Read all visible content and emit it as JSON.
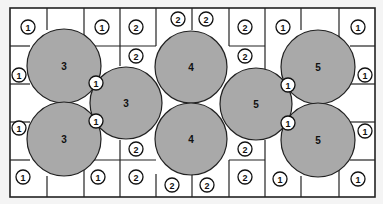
{
  "diagram": {
    "title": "",
    "grid": {
      "x": 10,
      "y": 8,
      "width": 365,
      "height": 189,
      "columns": [
        10,
        47,
        84,
        120,
        156,
        192,
        229,
        265,
        301,
        339,
        375
      ],
      "rows": [
        8,
        46,
        84,
        122,
        160,
        197
      ],
      "background": "#ffffff",
      "line_color": "#222222"
    },
    "partial_lines": [
      {
        "x1": 10,
        "y1": 46,
        "x2": 30,
        "y2": 46
      },
      {
        "x1": 10,
        "y1": 84,
        "x2": 30,
        "y2": 84
      },
      {
        "x1": 10,
        "y1": 122,
        "x2": 30,
        "y2": 122
      },
      {
        "x1": 10,
        "y1": 160,
        "x2": 30,
        "y2": 160
      },
      {
        "x1": 84,
        "y1": 8,
        "x2": 84,
        "y2": 46
      },
      {
        "x1": 120,
        "y1": 8,
        "x2": 120,
        "y2": 66
      },
      {
        "x1": 84,
        "y1": 160,
        "x2": 84,
        "y2": 197
      },
      {
        "x1": 120,
        "y1": 140,
        "x2": 120,
        "y2": 197
      },
      {
        "x1": 84,
        "y1": 46,
        "x2": 120,
        "y2": 46
      },
      {
        "x1": 84,
        "y1": 160,
        "x2": 120,
        "y2": 160
      },
      {
        "x1": 120,
        "y1": 46,
        "x2": 156,
        "y2": 46
      },
      {
        "x1": 120,
        "y1": 160,
        "x2": 156,
        "y2": 160
      },
      {
        "x1": 156,
        "y1": 8,
        "x2": 156,
        "y2": 46
      },
      {
        "x1": 192,
        "y1": 8,
        "x2": 192,
        "y2": 30
      },
      {
        "x1": 229,
        "y1": 8,
        "x2": 229,
        "y2": 46
      },
      {
        "x1": 156,
        "y1": 174,
        "x2": 156,
        "y2": 197
      },
      {
        "x1": 192,
        "y1": 174,
        "x2": 192,
        "y2": 197
      },
      {
        "x1": 229,
        "y1": 160,
        "x2": 229,
        "y2": 197
      },
      {
        "x1": 229,
        "y1": 46,
        "x2": 265,
        "y2": 46
      },
      {
        "x1": 229,
        "y1": 160,
        "x2": 265,
        "y2": 160
      },
      {
        "x1": 265,
        "y1": 8,
        "x2": 265,
        "y2": 70
      },
      {
        "x1": 265,
        "y1": 140,
        "x2": 265,
        "y2": 197
      },
      {
        "x1": 301,
        "y1": 8,
        "x2": 301,
        "y2": 30
      },
      {
        "x1": 301,
        "y1": 176,
        "x2": 301,
        "y2": 197
      },
      {
        "x1": 339,
        "y1": 8,
        "x2": 339,
        "y2": 46
      },
      {
        "x1": 339,
        "y1": 160,
        "x2": 339,
        "y2": 197
      },
      {
        "x1": 350,
        "y1": 46,
        "x2": 375,
        "y2": 46
      },
      {
        "x1": 350,
        "y1": 84,
        "x2": 375,
        "y2": 84
      },
      {
        "x1": 350,
        "y1": 122,
        "x2": 375,
        "y2": 122
      },
      {
        "x1": 350,
        "y1": 160,
        "x2": 375,
        "y2": 160
      },
      {
        "x1": 47,
        "y1": 8,
        "x2": 47,
        "y2": 30
      },
      {
        "x1": 47,
        "y1": 176,
        "x2": 47,
        "y2": 197
      }
    ],
    "discs": [
      {
        "label": "3",
        "cx": 64,
        "cy": 66,
        "r": 37
      },
      {
        "label": "3",
        "cx": 64,
        "cy": 139,
        "r": 37
      },
      {
        "label": "3",
        "cx": 126,
        "cy": 103,
        "r": 36
      },
      {
        "label": "4",
        "cx": 191,
        "cy": 67,
        "r": 36
      },
      {
        "label": "4",
        "cx": 191,
        "cy": 139,
        "r": 36
      },
      {
        "label": "5",
        "cx": 256,
        "cy": 104,
        "r": 36
      },
      {
        "label": "5",
        "cx": 318,
        "cy": 67,
        "r": 37
      },
      {
        "label": "5",
        "cx": 318,
        "cy": 140,
        "r": 37
      }
    ],
    "disc_fill": "#a9a9a9",
    "badges": [
      {
        "label": "1",
        "x": 28,
        "y": 27
      },
      {
        "label": "1",
        "x": 102,
        "y": 27
      },
      {
        "label": "2",
        "x": 136,
        "y": 27
      },
      {
        "label": "2",
        "x": 178,
        "y": 19
      },
      {
        "label": "2",
        "x": 206,
        "y": 19
      },
      {
        "label": "2",
        "x": 245,
        "y": 27
      },
      {
        "label": "1",
        "x": 283,
        "y": 27
      },
      {
        "label": "1",
        "x": 358,
        "y": 27
      },
      {
        "label": "2",
        "x": 136,
        "y": 56
      },
      {
        "label": "2",
        "x": 245,
        "y": 56
      },
      {
        "label": "1",
        "x": 19,
        "y": 75
      },
      {
        "label": "1",
        "x": 365,
        "y": 75
      },
      {
        "label": "1",
        "x": 96,
        "y": 83
      },
      {
        "label": "1",
        "x": 288,
        "y": 85
      },
      {
        "label": "1",
        "x": 96,
        "y": 121
      },
      {
        "label": "1",
        "x": 288,
        "y": 123
      },
      {
        "label": "1",
        "x": 19,
        "y": 128
      },
      {
        "label": "1",
        "x": 365,
        "y": 131
      },
      {
        "label": "2",
        "x": 136,
        "y": 149
      },
      {
        "label": "2",
        "x": 245,
        "y": 149
      },
      {
        "label": "1",
        "x": 23,
        "y": 177
      },
      {
        "label": "1",
        "x": 98,
        "y": 177
      },
      {
        "label": "2",
        "x": 136,
        "y": 177
      },
      {
        "label": "2",
        "x": 172,
        "y": 185
      },
      {
        "label": "2",
        "x": 207,
        "y": 185
      },
      {
        "label": "2",
        "x": 245,
        "y": 177
      },
      {
        "label": "1",
        "x": 280,
        "y": 179
      },
      {
        "label": "1",
        "x": 358,
        "y": 179
      }
    ]
  }
}
